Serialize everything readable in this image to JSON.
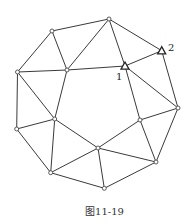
{
  "figure": {
    "caption": "图11-19",
    "labels": [
      {
        "id": "1",
        "text": "1",
        "x": 116,
        "y": 80
      },
      {
        "id": "2",
        "text": "2",
        "x": 168,
        "y": 51
      }
    ],
    "nodes": [
      {
        "id": "A",
        "x": 52,
        "y": 31,
        "shape": "circle"
      },
      {
        "id": "B",
        "x": 109,
        "y": 19,
        "shape": "circle"
      },
      {
        "id": "C",
        "x": 17.5,
        "y": 72,
        "shape": "circle"
      },
      {
        "id": "D",
        "x": 67,
        "y": 70,
        "shape": "circle"
      },
      {
        "id": "T1",
        "x": 125,
        "y": 66,
        "shape": "triangle",
        "label": "1"
      },
      {
        "id": "T2",
        "x": 161.7,
        "y": 50.7,
        "shape": "triangle",
        "label": "2"
      },
      {
        "id": "E",
        "x": 16.7,
        "y": 129,
        "shape": "circle"
      },
      {
        "id": "F",
        "x": 54.7,
        "y": 119,
        "shape": "circle"
      },
      {
        "id": "G",
        "x": 178,
        "y": 108,
        "shape": "circle"
      },
      {
        "id": "H",
        "x": 140,
        "y": 120,
        "shape": "circle"
      },
      {
        "id": "I",
        "x": 98,
        "y": 148,
        "shape": "circle"
      },
      {
        "id": "J",
        "x": 50.7,
        "y": 172.7,
        "shape": "circle"
      },
      {
        "id": "K",
        "x": 156,
        "y": 162,
        "shape": "circle"
      },
      {
        "id": "L",
        "x": 104.3,
        "y": 188.3,
        "shape": "circle"
      }
    ],
    "edges": [
      [
        "A",
        "B"
      ],
      [
        "A",
        "C"
      ],
      [
        "A",
        "D"
      ],
      [
        "B",
        "D"
      ],
      [
        "B",
        "T2"
      ],
      [
        "B",
        "T1"
      ],
      [
        "T1",
        "H"
      ],
      [
        "D",
        "T1"
      ],
      [
        "C",
        "D"
      ],
      [
        "C",
        "F"
      ],
      [
        "C",
        "E"
      ],
      [
        "D",
        "F"
      ],
      [
        "T1",
        "T2"
      ],
      [
        "T1",
        "G"
      ],
      [
        "T2",
        "G"
      ],
      [
        "E",
        "F"
      ],
      [
        "E",
        "J"
      ],
      [
        "F",
        "J"
      ],
      [
        "F",
        "I"
      ],
      [
        "H",
        "G"
      ],
      [
        "G",
        "K"
      ],
      [
        "H",
        "K"
      ],
      [
        "H",
        "I"
      ],
      [
        "I",
        "J"
      ],
      [
        "I",
        "K"
      ],
      [
        "I",
        "L"
      ],
      [
        "J",
        "L"
      ],
      [
        "K",
        "L"
      ]
    ]
  }
}
